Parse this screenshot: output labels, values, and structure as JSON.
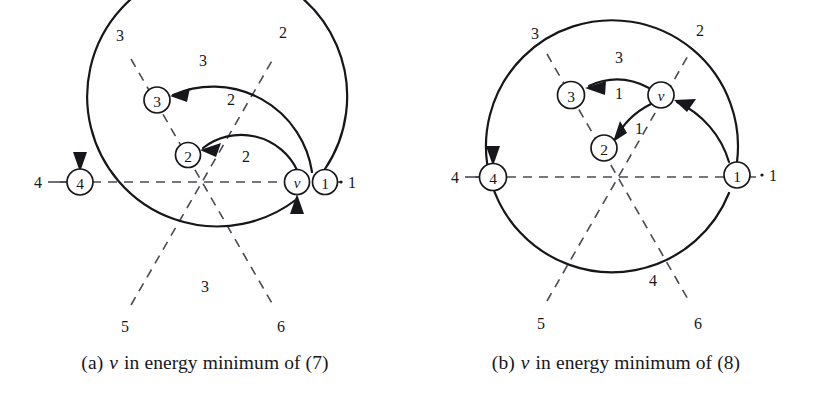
{
  "figure": {
    "background": "#ffffff",
    "ink_color": "#17171b",
    "dash_color": "#4a4a52",
    "panels": [
      {
        "id": "a",
        "caption": {
          "prefix": "(a)",
          "italic_symbol": "v",
          "text": "in energy minimum of (7)"
        },
        "center": {
          "x": 202,
          "y": 182
        },
        "spoke_labels": [
          {
            "name": "spoke-1",
            "label": "1",
            "x": 352,
            "y": 182,
            "leader": "dot"
          },
          {
            "name": "spoke-2",
            "label": "2",
            "x": 283,
            "y": 32
          },
          {
            "name": "spoke-3",
            "label": "3",
            "x": 120,
            "y": 35
          },
          {
            "name": "spoke-4",
            "label": "4",
            "x": 38,
            "y": 182
          },
          {
            "name": "spoke-5",
            "label": "5",
            "x": 125,
            "y": 326
          },
          {
            "name": "spoke-6",
            "label": "6",
            "x": 281,
            "y": 326
          }
        ],
        "nodes": [
          {
            "name": "node-1",
            "label": "1",
            "x": 325,
            "y": 182,
            "r": 12.5,
            "italic": false
          },
          {
            "name": "node-v",
            "label": "v",
            "x": 297,
            "y": 182,
            "r": 12.5,
            "italic": true
          },
          {
            "name": "node-2",
            "label": "2",
            "x": 188,
            "y": 155,
            "r": 12.5,
            "italic": false
          },
          {
            "name": "node-3",
            "label": "3",
            "x": 157,
            "y": 100,
            "r": 13,
            "italic": false
          },
          {
            "name": "node-4",
            "label": "4",
            "x": 80,
            "y": 182,
            "r": 13,
            "italic": false
          }
        ],
        "arc_labels": [
          {
            "name": "arc-label-outer-top",
            "label": "3",
            "x": 203,
            "y": 60
          },
          {
            "name": "arc-label-mid-top",
            "label": "2",
            "x": 231,
            "y": 99
          },
          {
            "name": "arc-label-inner",
            "label": "2",
            "x": 246,
            "y": 156
          },
          {
            "name": "arc-label-bottom",
            "label": "3",
            "x": 205,
            "y": 286
          }
        ]
      },
      {
        "id": "b",
        "caption": {
          "prefix": "(b)",
          "italic_symbol": "v",
          "text": "in energy minimum of (8)"
        },
        "center": {
          "x": 207,
          "y": 177
        },
        "spoke_labels": [
          {
            "name": "spoke-1",
            "label": "1",
            "x": 362,
            "y": 175,
            "leader": "dot"
          },
          {
            "name": "spoke-2",
            "label": "2",
            "x": 289,
            "y": 30
          },
          {
            "name": "spoke-3",
            "label": "3",
            "x": 124,
            "y": 33
          },
          {
            "name": "spoke-4",
            "label": "4",
            "x": 44,
            "y": 177
          },
          {
            "name": "spoke-5",
            "label": "5",
            "x": 130,
            "y": 323
          },
          {
            "name": "spoke-6",
            "label": "6",
            "x": 287,
            "y": 323
          }
        ],
        "nodes": [
          {
            "name": "node-1",
            "label": "1",
            "x": 326,
            "y": 175,
            "r": 13,
            "italic": false
          },
          {
            "name": "node-v",
            "label": "v",
            "x": 250,
            "y": 95,
            "r": 13,
            "italic": true
          },
          {
            "name": "node-2",
            "label": "2",
            "x": 193,
            "y": 148,
            "r": 13,
            "italic": false
          },
          {
            "name": "node-3",
            "label": "3",
            "x": 160,
            "y": 95,
            "r": 13.5,
            "italic": false
          },
          {
            "name": "node-4",
            "label": "4",
            "x": 82,
            "y": 177,
            "r": 13.5,
            "italic": false
          }
        ],
        "arc_labels": [
          {
            "name": "arc-label-outer-top",
            "label": "3",
            "x": 208,
            "y": 57
          },
          {
            "name": "arc-label-v-to-3",
            "label": "1",
            "x": 208,
            "y": 93
          },
          {
            "name": "arc-label-v-to-2",
            "label": "1",
            "x": 228,
            "y": 128
          },
          {
            "name": "arc-label-bottom",
            "label": "4",
            "x": 242,
            "y": 280
          }
        ]
      }
    ]
  }
}
